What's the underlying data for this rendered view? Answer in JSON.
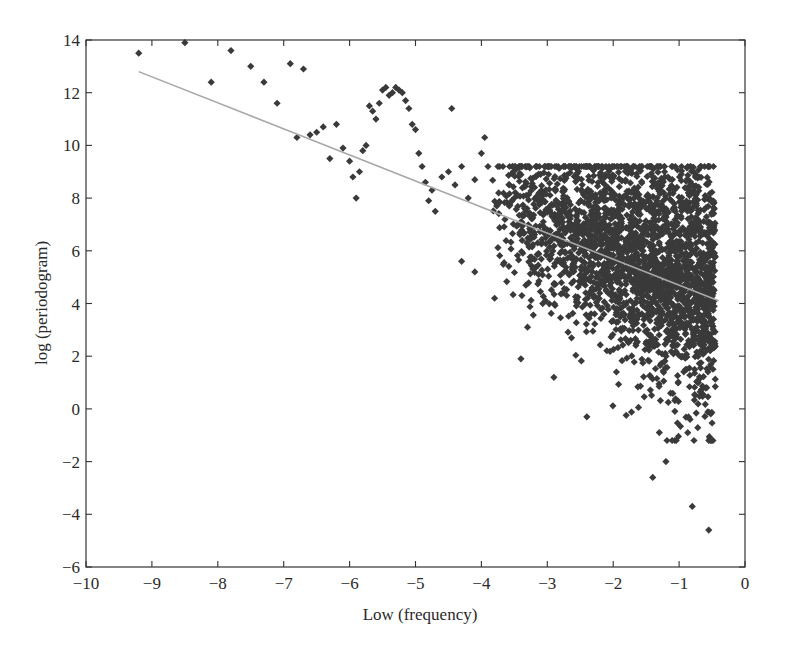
{
  "chart_data": {
    "type": "scatter",
    "title": "",
    "xlabel": "Low (frequency)",
    "ylabel": "log (periodogram)",
    "xlim": [
      -10,
      0
    ],
    "ylim": [
      -6,
      14
    ],
    "xticks": [
      -10,
      -9,
      -8,
      -7,
      -6,
      -5,
      -4,
      -3,
      -2,
      -1,
      0
    ],
    "yticks": [
      -6,
      -4,
      -2,
      0,
      2,
      4,
      6,
      8,
      10,
      12,
      14
    ],
    "grid": false,
    "legend": null,
    "marker": "diamond",
    "colors": {
      "points": "#3a3a3a",
      "fit_line": "#a8a8a8",
      "axes": "#333333",
      "background": "#ffffff"
    },
    "fit_line": {
      "name": "regression line",
      "x": [
        -9.2,
        -0.4
      ],
      "y": [
        12.8,
        4.1
      ]
    },
    "series": [
      {
        "name": "log periodogram points (sparse, low frequency)",
        "x": [
          -9.2,
          -8.5,
          -8.1,
          -7.8,
          -7.5,
          -7.3,
          -7.1,
          -6.9,
          -6.8,
          -6.7,
          -6.6,
          -6.5,
          -6.4,
          -6.3,
          -6.2,
          -6.1,
          -6.0,
          -5.95,
          -5.9,
          -5.85,
          -5.8,
          -5.75,
          -5.7,
          -5.65,
          -5.6,
          -5.55,
          -5.5,
          -5.45,
          -5.4,
          -5.35,
          -5.3,
          -5.25,
          -5.2,
          -5.15,
          -5.1,
          -5.05,
          -5.0,
          -4.95,
          -4.9,
          -4.85,
          -4.8,
          -4.75,
          -4.7,
          -4.6,
          -4.5,
          -4.45,
          -4.4,
          -4.3,
          -4.2,
          -4.1,
          -4.0,
          -3.95,
          -3.9
        ],
        "y": [
          13.5,
          13.9,
          12.4,
          13.6,
          13.0,
          12.4,
          11.6,
          13.1,
          10.3,
          12.9,
          10.4,
          10.5,
          10.7,
          9.5,
          10.8,
          9.9,
          9.4,
          8.8,
          8.0,
          9.0,
          9.8,
          10.0,
          11.5,
          11.3,
          11.0,
          11.6,
          12.1,
          12.2,
          11.9,
          12.0,
          12.2,
          12.1,
          12.0,
          11.7,
          11.4,
          10.8,
          10.6,
          9.7,
          9.2,
          8.6,
          7.9,
          8.3,
          7.5,
          8.8,
          9.0,
          11.4,
          8.5,
          9.2,
          8.0,
          8.7,
          9.7,
          10.3,
          9.2
        ]
      },
      {
        "name": "log periodogram points (dense, high frequency)",
        "x_range": [
          -3.9,
          -0.4
        ],
        "y_center_trend": "approximately 7.5 at x=-3.5 decreasing to 4.5 at x=-0.5",
        "y_spread": "roughly ±3 around trend; points extend up to ~9.5 at x≈-0.9 and down to ~0 near x≈-0.5",
        "outliers": [
          {
            "x": -1.4,
            "y": -2.6
          },
          {
            "x": -1.2,
            "y": -2.0
          },
          {
            "x": -0.8,
            "y": -3.7
          },
          {
            "x": -0.55,
            "y": -4.6
          },
          {
            "x": -1.3,
            "y": -0.9
          },
          {
            "x": -2.4,
            "y": -0.3
          },
          {
            "x": -3.4,
            "y": 1.9
          },
          {
            "x": -2.9,
            "y": 1.2
          },
          {
            "x": -3.3,
            "y": 3.1
          },
          {
            "x": -3.8,
            "y": 4.2
          },
          {
            "x": -4.3,
            "y": 5.6
          },
          {
            "x": -4.1,
            "y": 5.2
          }
        ],
        "approx_point_count": 2600
      }
    ]
  }
}
